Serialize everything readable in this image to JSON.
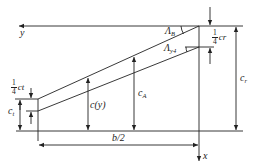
{
  "diagram": {
    "type": "wing planform geometry (half-span, swept tapered wing)",
    "axes": {
      "y_label": "y",
      "x_label": "x"
    },
    "labels": {
      "sweep_leading_edge": "Λ",
      "sweep_leading_edge_sub": "B",
      "sweep_quarter_chord": "Λ",
      "sweep_quarter_chord_sub": "y4",
      "quarter_root_chord_num": "1",
      "quarter_root_chord_den": "4",
      "quarter_root_chord_var": "c",
      "quarter_root_chord_sub": "r",
      "quarter_tip_chord_num": "1",
      "quarter_tip_chord_den": "4",
      "quarter_tip_chord_var": "c",
      "quarter_tip_chord_sub": "t",
      "tip_chord": "c",
      "tip_chord_sub": "t",
      "local_chord": "c(y)",
      "mean_chord": "c",
      "mean_chord_sub": "A",
      "root_chord": "c",
      "root_chord_sub": "r",
      "half_span": "b/2"
    },
    "colors": {
      "stroke": "#222222",
      "background": "#ffffff"
    }
  }
}
